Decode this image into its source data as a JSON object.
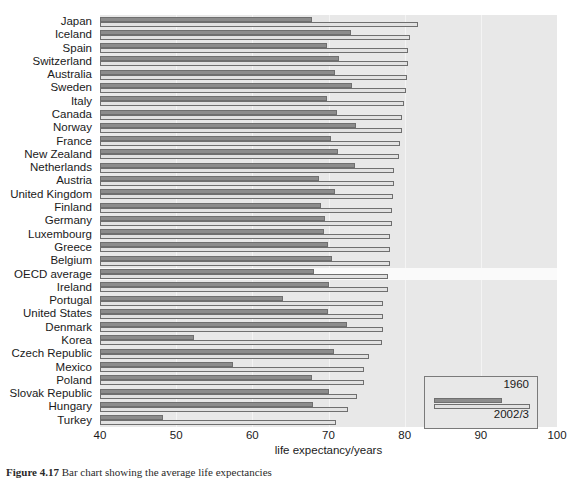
{
  "chart_data": {
    "type": "bar",
    "orientation": "horizontal",
    "title": "",
    "xlabel": "life expectancy/years",
    "ylabel": "",
    "xlim": [
      40,
      100
    ],
    "xticks": [
      40,
      50,
      60,
      70,
      80,
      90,
      100
    ],
    "grid": "vertical-only",
    "legend_position": "bottom-right",
    "legend": [
      "1960",
      "2002/3"
    ],
    "categories": [
      "Japan",
      "Iceland",
      "Spain",
      "Switzerland",
      "Australia",
      "Sweden",
      "Italy",
      "Canada",
      "Norway",
      "France",
      "New Zealand",
      "Netherlands",
      "Austria",
      "United Kingdom",
      "Finland",
      "Germany",
      "Luxembourg",
      "Greece",
      "Belgium",
      "OECD average",
      "Ireland",
      "Portugal",
      "United States",
      "Denmark",
      "Korea",
      "Czech Republic",
      "Mexico",
      "Poland",
      "Slovak Republic",
      "Hungary",
      "Turkey"
    ],
    "highlight_category": "OECD average",
    "series": [
      {
        "name": "1960",
        "values": [
          67.8,
          73.0,
          69.8,
          71.4,
          70.9,
          73.1,
          69.8,
          71.1,
          73.6,
          70.3,
          71.3,
          73.5,
          68.8,
          70.8,
          69.0,
          69.6,
          69.4,
          69.9,
          70.4,
          68.1,
          70.0,
          64.0,
          69.9,
          72.4,
          52.4,
          70.7,
          57.5,
          67.8,
          70.1,
          68.0,
          48.3
        ]
      },
      {
        "name": "2002/3",
        "values": [
          81.8,
          80.7,
          80.5,
          80.4,
          80.3,
          80.2,
          79.9,
          79.7,
          79.6,
          79.4,
          79.2,
          78.6,
          78.6,
          78.5,
          78.3,
          78.3,
          78.1,
          78.1,
          78.1,
          77.8,
          77.8,
          77.1,
          77.2,
          77.1,
          77.0,
          75.3,
          74.6,
          74.6,
          73.7,
          72.6,
          71.0
        ]
      }
    ]
  },
  "axis": {
    "tick_labels": [
      "40",
      "50",
      "60",
      "70",
      "80",
      "90",
      "100"
    ],
    "x_axis_title": "life expectancy/years"
  },
  "legend": {
    "label_1960": "1960",
    "label_2002": "2002/3"
  },
  "caption": {
    "figure_number": "Figure 4.17",
    "text": "Bar chart showing the average life expectancies"
  }
}
